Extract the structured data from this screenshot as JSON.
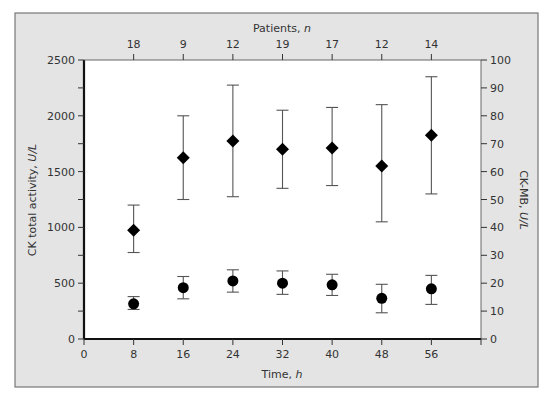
{
  "chart_data": {
    "type": "scatter",
    "title": "",
    "xlabel": "Time, h",
    "xlabel_main": "Time, ",
    "xlabel_unit": "h",
    "ylabel_left": "CK total activity, U/L",
    "ylabel_left_main": "CK total activity, ",
    "ylabel_left_unit": "U/L",
    "ylabel_right": "CK-MB, U/L",
    "ylabel_right_main": "CK-MB, ",
    "ylabel_right_unit": "U/L",
    "top_axis_label": "Patients, n",
    "top_axis_label_main": "Patients, ",
    "top_axis_label_unit": "n",
    "xlim": [
      0,
      64
    ],
    "ylim_left": [
      0,
      2500
    ],
    "ylim_right": [
      0,
      100
    ],
    "x_ticks": [
      0,
      8,
      16,
      24,
      32,
      40,
      48,
      56
    ],
    "y_left_ticks": [
      0,
      500,
      1000,
      1500,
      2000,
      2500
    ],
    "y_left_minor_ticks": [
      250,
      750,
      1250,
      1750,
      2250
    ],
    "y_right_ticks": [
      0,
      10,
      20,
      30,
      40,
      50,
      60,
      70,
      80,
      90,
      100
    ],
    "x": [
      8,
      16,
      24,
      32,
      40,
      48,
      56
    ],
    "patients_n": [
      18,
      9,
      12,
      19,
      17,
      12,
      14
    ],
    "grid": false,
    "legend": "none",
    "series": [
      {
        "name": "CK total activity",
        "axis": "left",
        "marker": "circle",
        "values": [
          315,
          460,
          520,
          500,
          485,
          365,
          450
        ],
        "err_low": [
          265,
          360,
          420,
          400,
          390,
          235,
          310
        ],
        "err_high": [
          380,
          560,
          620,
          610,
          580,
          490,
          570
        ]
      },
      {
        "name": "CK-MB",
        "axis": "right",
        "marker": "diamond",
        "values": [
          39,
          65,
          71,
          68,
          68.5,
          62,
          73
        ],
        "err_low": [
          31,
          50,
          51,
          54,
          55,
          42,
          52
        ],
        "err_high": [
          48,
          80,
          91,
          82,
          83,
          84,
          94
        ]
      }
    ],
    "colors": {
      "frame_bg": "#e4e4e4",
      "plot_bg": "#ffffff",
      "axis": "#111111",
      "marker": "#000000",
      "errorbar": "#555555"
    }
  }
}
